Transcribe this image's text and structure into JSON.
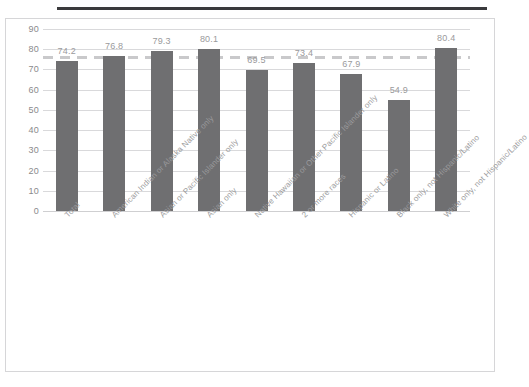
{
  "chart_data": {
    "type": "bar",
    "title": "",
    "subtitle": "",
    "xlabel": "",
    "ylabel": "",
    "ylim": [
      0,
      90
    ],
    "ytick_step": 10,
    "yticks": [
      "90",
      "80",
      "70",
      "60",
      "50",
      "40",
      "30",
      "20",
      "10",
      "0"
    ],
    "grid": true,
    "legend": "none",
    "bar_color": "#6f6f71",
    "gridline_color": "#d9d9db",
    "label_color": "#9a9a9c",
    "categories": [
      "Total",
      "American Indian or Alaska Native only",
      "Asian or Pacific Islander only",
      "Asian only",
      "Native Hawaiian or Other Pacific Islander only",
      "2 or more races",
      "Hispanic or Latino",
      "Black only, not Hispanic/Latino",
      "White only, not Hispanic/Latino"
    ],
    "values": [
      74.2,
      76.8,
      79.3,
      80.1,
      69.5,
      73.4,
      67.9,
      54.9,
      80.4
    ],
    "data_labels": [
      "74.2",
      "76.8",
      "79.3",
      "80.1",
      "69.5",
      "73.4",
      "67.9",
      "54.9",
      "80.4"
    ],
    "reference_line": {
      "value": 76.2,
      "style": "dashed",
      "color": "#c9c9cb",
      "label": ""
    }
  }
}
